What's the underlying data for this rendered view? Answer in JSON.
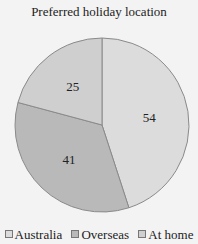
{
  "chart_data": {
    "type": "pie",
    "title": "Preferred holiday location",
    "slices": [
      {
        "label": "Australia",
        "value": 54,
        "color": "#dcdcdc"
      },
      {
        "label": "Overseas",
        "value": 41,
        "color": "#b9b9b9"
      },
      {
        "label": "At home",
        "value": 25,
        "color": "#cfcfcf"
      }
    ],
    "legend_position": "bottom",
    "start": "top",
    "direction": "clockwise"
  }
}
